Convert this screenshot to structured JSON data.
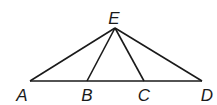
{
  "diagram": {
    "points": {
      "A": {
        "label": "A",
        "x": 30,
        "y": 81,
        "lx": 22,
        "ly": 95
      },
      "B": {
        "label": "B",
        "x": 87,
        "y": 81,
        "lx": 87,
        "ly": 95
      },
      "C": {
        "label": "C",
        "x": 144,
        "y": 81,
        "lx": 144,
        "ly": 95
      },
      "D": {
        "label": "D",
        "x": 202,
        "y": 81,
        "lx": 207,
        "ly": 95
      },
      "E": {
        "label": "E",
        "x": 115,
        "y": 28,
        "lx": 114,
        "ly": 18
      }
    },
    "segments": [
      [
        "A",
        "D"
      ],
      [
        "E",
        "A"
      ],
      [
        "E",
        "B"
      ],
      [
        "E",
        "C"
      ],
      [
        "E",
        "D"
      ]
    ],
    "stroke_color": "#1a1a1a"
  }
}
